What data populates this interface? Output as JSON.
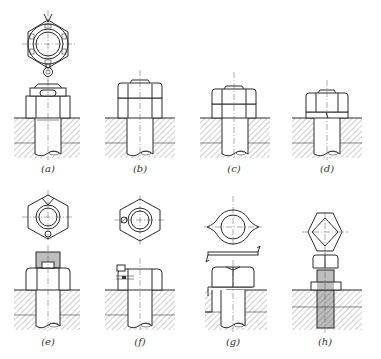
{
  "figure": {
    "type": "technical-drawing",
    "background": "#ffffff",
    "line_color": "#2a2a2a",
    "rows": 2,
    "columns": 4
  },
  "panels": [
    {
      "id": "a",
      "label": "(a)",
      "views": [
        "top-view-castle-nut-with-split-pin",
        "front-section-castle-nut-on-bolt"
      ]
    },
    {
      "id": "b",
      "label": "(b)",
      "views": [
        "front-section-double-nut-jam"
      ]
    },
    {
      "id": "c",
      "label": "(c)",
      "views": [
        "front-section-double-nut-thin-jam"
      ]
    },
    {
      "id": "d",
      "label": "(d)",
      "views": [
        "front-section-nut-with-spring-washer"
      ]
    },
    {
      "id": "e",
      "label": "(e)",
      "views": [
        "top-view-slotted-nut-with-pin",
        "front-section-slotted-nut-threaded-end"
      ]
    },
    {
      "id": "f",
      "label": "(f)",
      "views": [
        "top-view-nut-with-set-screw",
        "front-section-nut-with-set-screw"
      ]
    },
    {
      "id": "g",
      "label": "(g)",
      "views": [
        "top-view-tab-washer",
        "side-view-tab-washer",
        "front-section-nut-with-tab-washer"
      ]
    },
    {
      "id": "h",
      "label": "(h)",
      "views": [
        "top-view-bolt-with-square-head-nut",
        "front-section-threaded-stud-with-lock-nut"
      ]
    }
  ]
}
